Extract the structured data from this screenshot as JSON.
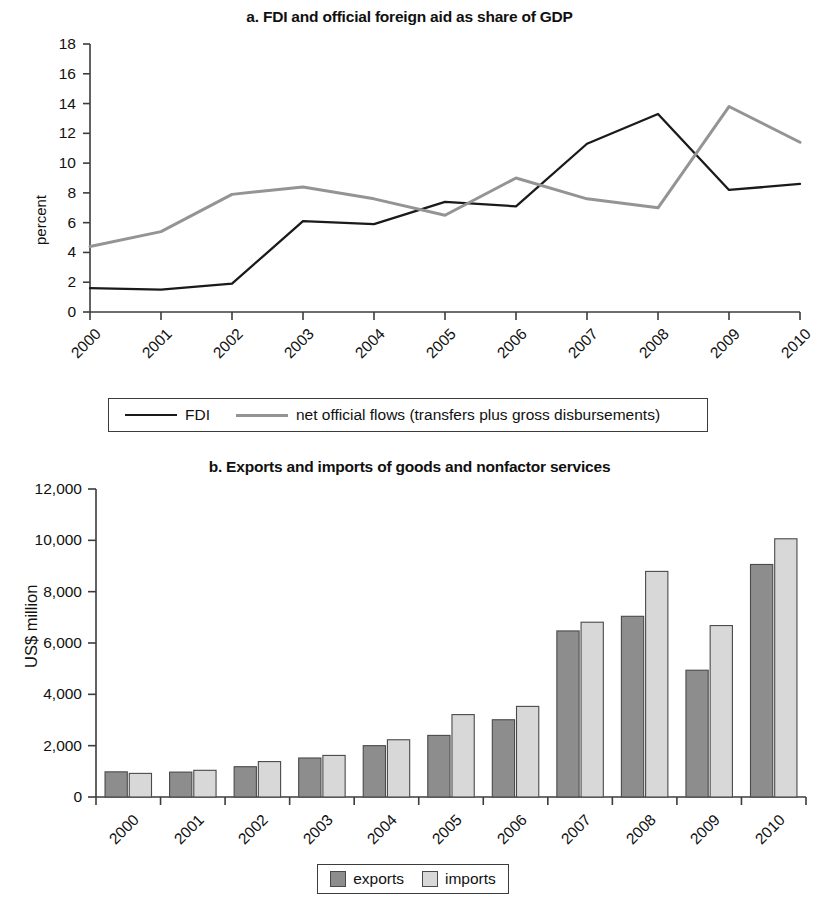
{
  "figure": {
    "panel_a_title": "a. FDI and official foreign aid as share of GDP",
    "panel_b_title": "b. Exports and imports of goods and nonfactor services"
  },
  "colors": {
    "fdi_line": "#1a1a1a",
    "net_official_flows_line": "#949494",
    "exports_bar": "#8d8d8d",
    "imports_bar": "#d8d8d8",
    "bar_border": "#4a4a4a",
    "axis": "#3c3c3c",
    "text": "#111111"
  },
  "legend_a": {
    "items": [
      {
        "label": "FDI",
        "marker": "line",
        "color": "#1a1a1a"
      },
      {
        "label": "net official flows (transfers plus gross disbursements)",
        "marker": "line",
        "color": "#949494"
      }
    ]
  },
  "legend_b": {
    "items": [
      {
        "label": "exports",
        "marker": "swatch",
        "color": "#8d8d8d"
      },
      {
        "label": "imports",
        "marker": "swatch",
        "color": "#d8d8d8"
      }
    ]
  },
  "chart_data": [
    {
      "type": "line",
      "title": "a. FDI and official foreign aid as share of GDP",
      "xlabel": "",
      "ylabel": "percent",
      "x": [
        "2000",
        "2001",
        "2002",
        "2003",
        "2004",
        "2005",
        "2006",
        "2007",
        "2008",
        "2009",
        "2010"
      ],
      "xtick_labels": [
        "2000",
        "2001",
        "2002",
        "2003",
        "2004",
        "2005",
        "2006",
        "2007",
        "2008",
        "2009",
        "2010"
      ],
      "ylim": [
        0,
        18
      ],
      "yticks": [
        0,
        2,
        4,
        6,
        8,
        10,
        12,
        14,
        16,
        18
      ],
      "ytick_labels": [
        "0",
        "2",
        "4",
        "6",
        "8",
        "10",
        "12",
        "14",
        "16",
        "18"
      ],
      "grid": false,
      "legend_position": "below",
      "series": [
        {
          "name": "FDI",
          "color": "#1a1a1a",
          "values": [
            1.6,
            1.5,
            1.9,
            6.1,
            5.9,
            7.4,
            7.1,
            11.3,
            13.3,
            8.2,
            8.6
          ]
        },
        {
          "name": "net official flows (transfers plus gross disbursements)",
          "color": "#949494",
          "values": [
            4.4,
            5.4,
            7.9,
            8.4,
            7.6,
            6.5,
            9.0,
            7.6,
            7.0,
            13.8,
            11.4
          ]
        }
      ]
    },
    {
      "type": "bar",
      "title": "b. Exports and imports of goods and nonfactor services",
      "xlabel": "",
      "ylabel": "US$ million",
      "categories": [
        "2000",
        "2001",
        "2002",
        "2003",
        "2004",
        "2005",
        "2006",
        "2007",
        "2008",
        "2009",
        "2010"
      ],
      "ylim": [
        0,
        12000
      ],
      "yticks": [
        0,
        2000,
        4000,
        6000,
        8000,
        10000,
        12000
      ],
      "ytick_labels": [
        "0",
        "2,000",
        "4,000",
        "6,000",
        "8,000",
        "10,000",
        "12,000"
      ],
      "grid": false,
      "legend_position": "below",
      "series": [
        {
          "name": "exports",
          "color": "#8d8d8d",
          "values": [
            980,
            970,
            1180,
            1520,
            2000,
            2400,
            3010,
            6470,
            7040,
            4940,
            9060
          ]
        },
        {
          "name": "imports",
          "color": "#d8d8d8",
          "values": [
            920,
            1040,
            1380,
            1620,
            2230,
            3210,
            3530,
            6810,
            8790,
            6680,
            10060
          ]
        }
      ]
    }
  ]
}
